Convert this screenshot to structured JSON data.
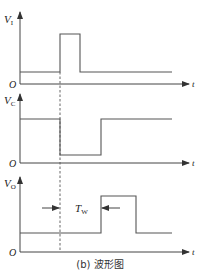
{
  "figure": {
    "caption": "(b) 波形图",
    "time_axis_label": "t",
    "origin_label": "O",
    "panels": [
      {
        "id": "vi",
        "y_label": "V",
        "y_sub": "I",
        "description": "Input trigger pulse: low level, brief high pulse, back to low"
      },
      {
        "id": "vc",
        "y_label": "V",
        "y_sub": "C",
        "description": "Capacitor voltage: high, drops at trigger, recovers after Tw"
      },
      {
        "id": "vo",
        "y_label": "V",
        "y_sub": "O",
        "description": "Output: low, goes high for duration Tw, returns low"
      }
    ],
    "annotation": {
      "label": "T",
      "sub": "W"
    }
  },
  "colors": {
    "line": "#555555",
    "text": "#222222",
    "background": "#ffffff"
  }
}
